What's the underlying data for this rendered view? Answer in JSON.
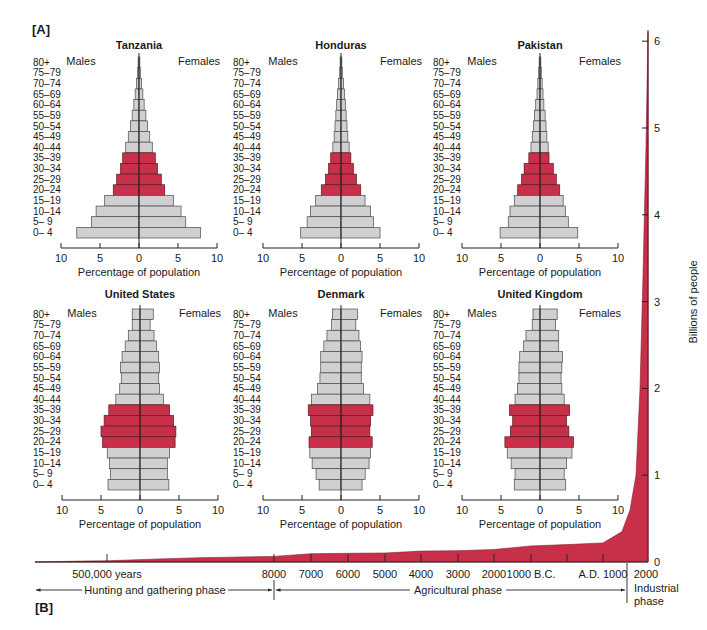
{
  "figure": {
    "panel_a_label": "[A]",
    "panel_b_label": "[B]"
  },
  "chart_data": [
    {
      "type": "bar",
      "subtype": "population-pyramid",
      "title": "Tanzania",
      "left_label": "Males",
      "right_label": "Females",
      "xlabel": "Percentage of population",
      "xticks": [
        "10",
        "5",
        "0",
        "5",
        "10"
      ],
      "xlim": [
        -10,
        10
      ],
      "categories": [
        "80+",
        "75–79",
        "70–74",
        "65–69",
        "60–64",
        "55–59",
        "50–54",
        "45–49",
        "40–44",
        "35–39",
        "30–34",
        "25–29",
        "20–24",
        "15–19",
        "10–14",
        "5– 9",
        "0– 4"
      ],
      "highlighted_categories": [
        "35–39",
        "30–34",
        "25–29",
        "20–24"
      ],
      "series": [
        {
          "name": "Males",
          "values": [
            0.2,
            0.3,
            0.6,
            0.9,
            1.2,
            1.6,
            2.0,
            2.5,
            3.1,
            3.8,
            4.3,
            5.2,
            6.0,
            8.0,
            10.0,
            11.1,
            14.5
          ]
        },
        {
          "name": "Females",
          "values": [
            0.2,
            0.3,
            0.6,
            0.9,
            1.2,
            1.6,
            2.0,
            2.5,
            3.1,
            3.8,
            4.3,
            5.2,
            6.0,
            8.0,
            9.8,
            10.9,
            14.3
          ]
        }
      ]
    },
    {
      "type": "bar",
      "subtype": "population-pyramid",
      "title": "Honduras",
      "left_label": "Males",
      "right_label": "Females",
      "xlabel": "Percentage of population",
      "xticks": [
        "10",
        "5",
        "0",
        "5",
        "10"
      ],
      "xlim": [
        -10,
        10
      ],
      "categories": [
        "80+",
        "75–79",
        "70–74",
        "65–69",
        "60–64",
        "55–59",
        "50–54",
        "45–49",
        "40–44",
        "35–39",
        "30–34",
        "25–29",
        "20–24",
        "15–19",
        "10–14",
        "5– 9",
        "0– 4"
      ],
      "highlighted_categories": [
        "35–39",
        "30–34",
        "25–29",
        "20–24"
      ],
      "series": [
        {
          "name": "Males",
          "values": [
            0.2,
            0.3,
            0.6,
            0.8,
            1.0,
            1.2,
            1.4,
            1.6,
            1.9,
            2.4,
            2.9,
            3.6,
            4.6,
            5.9,
            7.1,
            7.9,
            9.4
          ]
        },
        {
          "name": "Females",
          "values": [
            0.2,
            0.3,
            0.6,
            0.8,
            1.0,
            1.2,
            1.4,
            1.6,
            1.9,
            2.3,
            2.9,
            3.6,
            4.6,
            5.6,
            6.9,
            7.6,
            9.1
          ]
        }
      ]
    },
    {
      "type": "bar",
      "subtype": "population-pyramid",
      "title": "Pakistan",
      "left_label": "Males",
      "right_label": "Females",
      "xlabel": "Percentage of population",
      "xticks": [
        "10",
        "5",
        "0",
        "5",
        "10"
      ],
      "xlim": [
        -10,
        10
      ],
      "categories": [
        "80+",
        "75–79",
        "70–74",
        "65–69",
        "60–64",
        "55–59",
        "50–54",
        "45–49",
        "40–44",
        "35–39",
        "30–34",
        "25–29",
        "20–24",
        "15–19",
        "10–14",
        "5– 9",
        "0– 4"
      ],
      "highlighted_categories": [
        "35–39",
        "30–34",
        "25–29",
        "20–24"
      ],
      "series": [
        {
          "name": "Males",
          "values": [
            0.2,
            0.3,
            0.5,
            0.7,
            1.0,
            1.3,
            1.5,
            1.8,
            2.1,
            2.6,
            3.7,
            4.3,
            5.2,
            6.0,
            7.0,
            7.4,
            9.3
          ]
        },
        {
          "name": "Females",
          "values": [
            0.2,
            0.3,
            0.5,
            0.7,
            0.9,
            1.2,
            1.4,
            1.6,
            1.9,
            2.1,
            3.1,
            3.8,
            4.6,
            5.4,
            5.9,
            6.6,
            8.8
          ]
        }
      ]
    },
    {
      "type": "bar",
      "subtype": "population-pyramid",
      "title": "United States",
      "left_label": "Males",
      "right_label": "Females",
      "xlabel": "Percentage of population",
      "xticks": [
        "10",
        "5",
        "0",
        "5",
        "10"
      ],
      "xlim": [
        -10,
        10
      ],
      "categories": [
        "80+",
        "75–79",
        "70–74",
        "65–69",
        "60–64",
        "55–59",
        "50–54",
        "45–49",
        "40–44",
        "35–39",
        "30–34",
        "25–29",
        "20–24",
        "15–19",
        "10–14",
        "5– 9",
        "0– 4"
      ],
      "highlighted_categories": [
        "35–39",
        "30–34",
        "25–29",
        "20–24"
      ],
      "series": [
        {
          "name": "Males",
          "values": [
            1.0,
            1.0,
            1.5,
            1.9,
            2.3,
            2.5,
            2.4,
            2.6,
            3.1,
            4.0,
            4.6,
            5.0,
            4.8,
            4.2,
            3.9,
            3.8,
            4.1
          ]
        },
        {
          "name": "Females",
          "values": [
            1.7,
            1.3,
            1.8,
            2.1,
            2.4,
            2.5,
            2.4,
            2.5,
            3.0,
            3.8,
            4.3,
            4.6,
            4.5,
            3.8,
            3.5,
            3.5,
            3.7
          ]
        }
      ]
    },
    {
      "type": "bar",
      "subtype": "population-pyramid",
      "title": "Denmark",
      "left_label": "Males",
      "right_label": "Females",
      "xlabel": "Percentage of population",
      "xticks": [
        "10",
        "5",
        "0",
        "5",
        "10"
      ],
      "xlim": [
        -10,
        10
      ],
      "categories": [
        "80+",
        "75–79",
        "70–74",
        "65–69",
        "60–64",
        "55–59",
        "50–54",
        "45–49",
        "40–44",
        "35–39",
        "30–34",
        "25–29",
        "20–24",
        "15–19",
        "10–14",
        "5– 9",
        "0– 4"
      ],
      "highlighted_categories": [
        "35–39",
        "30–34",
        "25–29",
        "20–24"
      ],
      "series": [
        {
          "name": "Males",
          "values": [
            1.1,
            1.2,
            1.8,
            2.2,
            2.6,
            2.6,
            2.7,
            3.0,
            3.8,
            4.2,
            3.9,
            3.8,
            4.1,
            4.0,
            3.7,
            3.2,
            2.8
          ]
        },
        {
          "name": "Females",
          "values": [
            2.1,
            1.9,
            2.3,
            2.5,
            2.7,
            2.6,
            2.6,
            2.9,
            3.7,
            4.1,
            3.8,
            3.7,
            4.0,
            3.8,
            3.6,
            3.1,
            2.7
          ]
        }
      ]
    },
    {
      "type": "bar",
      "subtype": "population-pyramid",
      "title": "United Kingdom",
      "left_label": "Males",
      "right_label": "Females",
      "xlabel": "Percentage of population",
      "xticks": [
        "10",
        "5",
        "0",
        "5",
        "10"
      ],
      "xlim": [
        -10,
        10
      ],
      "categories": [
        "80+",
        "75–79",
        "70–74",
        "65–69",
        "60–64",
        "55–59",
        "50–54",
        "45–49",
        "40–44",
        "35–39",
        "30–34",
        "25–29",
        "20–24",
        "15–19",
        "10–14",
        "5– 9",
        "0– 4"
      ],
      "highlighted_categories": [
        "35–39",
        "30–34",
        "25–29",
        "20–24"
      ],
      "series": [
        {
          "name": "Males",
          "values": [
            0.9,
            1.0,
            1.8,
            2.1,
            2.6,
            2.7,
            2.7,
            2.9,
            3.2,
            3.9,
            3.5,
            3.8,
            4.5,
            4.2,
            3.7,
            3.2,
            3.3
          ]
        },
        {
          "name": "Females",
          "values": [
            2.2,
            2.0,
            2.4,
            2.4,
            2.9,
            2.8,
            2.7,
            2.8,
            3.1,
            3.8,
            3.4,
            3.7,
            4.3,
            4.1,
            3.4,
            3.1,
            3.3
          ]
        }
      ]
    },
    {
      "type": "area",
      "title": "World population growth",
      "ylabel": "Billions of people",
      "ylim": [
        0,
        6
      ],
      "yticks": [
        "0",
        "1",
        "2",
        "3",
        "4",
        "5",
        "6"
      ],
      "xtick_labels": [
        "500,000 years",
        "8000",
        "7000",
        "6000",
        "5000",
        "4000",
        "3000",
        "2000",
        "1000 B.C.",
        "A.D. 1000",
        "2000"
      ],
      "phases": [
        {
          "label": "Hunting and gathering phase",
          "from": "500,000 years ago",
          "to": "8000 B.C."
        },
        {
          "label": "Agricultural phase",
          "from": "8000 B.C.",
          "to": "~A.D. 1750"
        },
        {
          "label": "Industrial phase",
          "from": "~A.D. 1750",
          "to": "2000"
        }
      ],
      "x": [
        "start",
        "500,000 years",
        "8000 B.C.",
        "7000 B.C.",
        "6000 B.C.",
        "5000 B.C.",
        "4000 B.C.",
        "3000 B.C.",
        "2000 B.C.",
        "1000 B.C.",
        "A.D. 1",
        "A.D. 1000",
        "A.D. 1750",
        "A.D. 1850",
        "A.D. 1930",
        "A.D. 1960",
        "A.D. 1975",
        "A.D. 1987",
        "A.D. 1999"
      ],
      "values": [
        0.0,
        0.01,
        0.05,
        0.06,
        0.07,
        0.08,
        0.09,
        0.1,
        0.13,
        0.15,
        0.18,
        0.2,
        0.5,
        1.0,
        2.0,
        3.0,
        4.0,
        5.0,
        6.0
      ]
    }
  ]
}
